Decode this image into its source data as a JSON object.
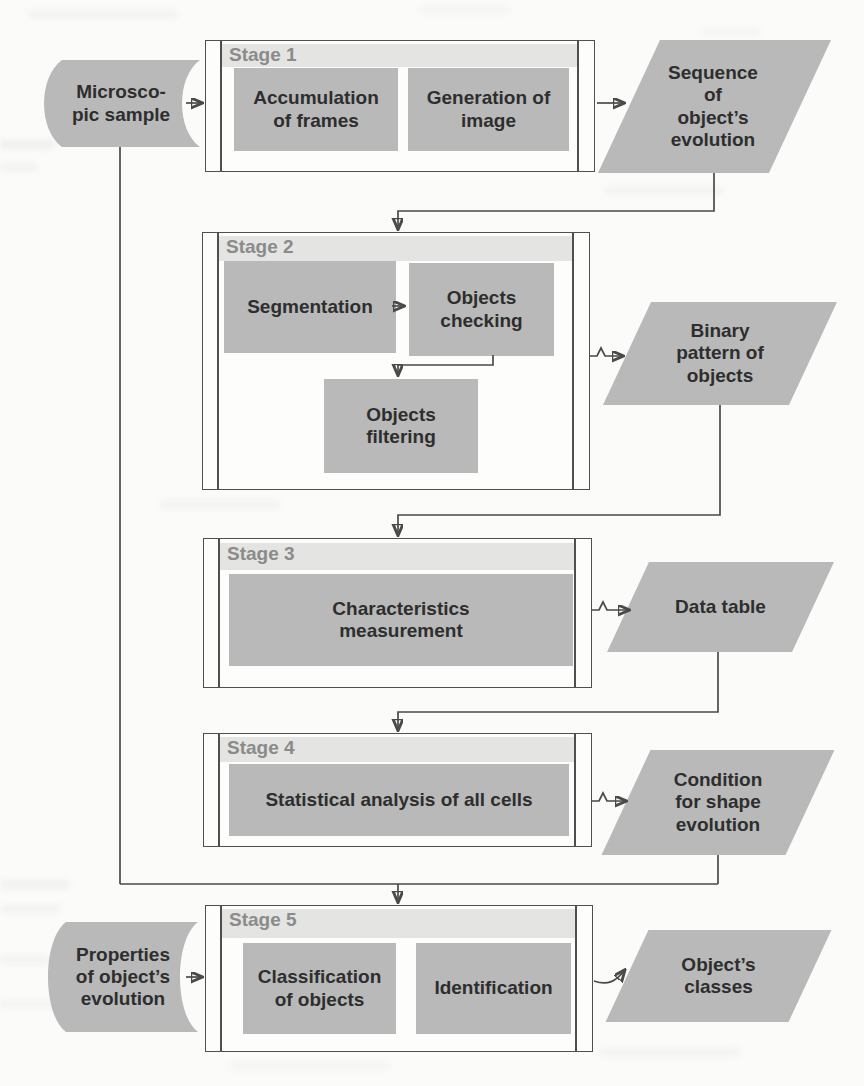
{
  "diagram": {
    "stages": [
      {
        "label": "Stage 1",
        "boxes": [
          "Accumulation\nof frames",
          "Generation of\nimage"
        ]
      },
      {
        "label": "Stage 2",
        "boxes": [
          "Segmentation",
          "Objects\nchecking",
          "Objects\nfiltering"
        ]
      },
      {
        "label": "Stage 3",
        "boxes": [
          "Characteristics\nmeasurement"
        ]
      },
      {
        "label": "Stage 4",
        "boxes": [
          "Statistical analysis of all cells"
        ]
      },
      {
        "label": "Stage 5",
        "boxes": [
          "Classification\nof objects",
          "Identification"
        ]
      }
    ],
    "inputs": [
      {
        "text": "Microsco-\npic sample"
      },
      {
        "text": "Properties\nof object’s\nevolution"
      }
    ],
    "outputs": [
      {
        "text": "Sequence\nof\nobject’s\nevolution"
      },
      {
        "text": "Binary\npattern of\nobjects"
      },
      {
        "text": "Data table"
      },
      {
        "text": "Condition\nfor shape\nevolution"
      },
      {
        "text": "Object’s\nclasses"
      }
    ],
    "colors": {
      "node_fill": "#b9b9b9",
      "stage_fill": "#fdfdfc",
      "header_fill": "#e4e4e2",
      "line": "#4a4a4a",
      "text": "#2e2e2e",
      "stage_label": "#8b8b8b"
    }
  }
}
